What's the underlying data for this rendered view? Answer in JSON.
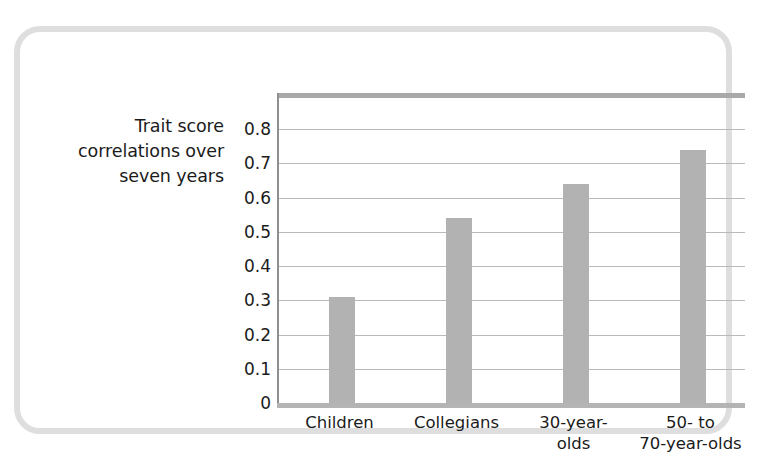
{
  "chart_data": {
    "type": "bar",
    "title": "",
    "ylabel": "Trait score correlations over seven years",
    "xlabel": "",
    "categories": [
      "Children",
      "Collegians",
      "30-year-olds",
      "50- to 70-year-olds"
    ],
    "values": [
      0.31,
      0.54,
      0.64,
      0.74
    ],
    "ylim": [
      0,
      0.8
    ],
    "ytick_labels": [
      "0.8",
      "0.7",
      "0.6",
      "0.5",
      "0.4",
      "0.3",
      "0.2",
      "0.1",
      "0"
    ],
    "ytick_values": [
      0.8,
      0.7,
      0.6,
      0.5,
      0.4,
      0.3,
      0.2,
      0.1,
      0
    ],
    "grid": true,
    "legend": "none",
    "series_color": "#b2b2b2"
  },
  "axis_title": {
    "line1": "Trait score",
    "line2": "correlations over",
    "line3": "seven years"
  },
  "x_labels": [
    {
      "line1": "Children",
      "line2": ""
    },
    {
      "line1": "Collegians",
      "line2": ""
    },
    {
      "line1": "30-year-",
      "line2": "olds"
    },
    {
      "line1": "50- to",
      "line2": "70-year-olds"
    }
  ],
  "y_labels": [
    "0.8",
    "0.7",
    "0.6",
    "0.5",
    "0.4",
    "0.3",
    "0.2",
    "0.1",
    "0"
  ],
  "colors": {
    "bar": "#b2b2b2",
    "grid": "#b9b9b9",
    "frame": "#dedede",
    "text": "#1b1b1b"
  }
}
